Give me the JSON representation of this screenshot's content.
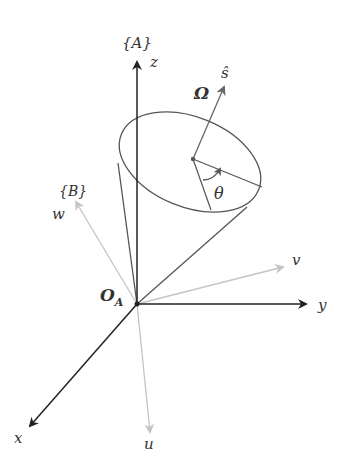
{
  "frames": {
    "A": {
      "label": "{A}",
      "origin_label": "O",
      "origin_sub": "A",
      "axes": {
        "x": "x",
        "y": "y",
        "z": "z"
      },
      "color": "#222222"
    },
    "B": {
      "label": "{B}",
      "axes": {
        "u": "u",
        "v": "v",
        "w": "w"
      },
      "color": "#bbbbbb"
    }
  },
  "cone": {
    "axis_label": "ŝ",
    "omega_label": "Ω",
    "angle_label": "θ",
    "color": "#555555"
  }
}
